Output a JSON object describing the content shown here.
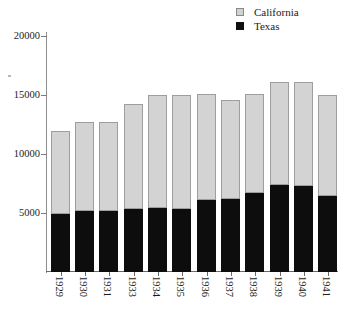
{
  "legend": {
    "position": "top-right",
    "items": [
      {
        "label": "California",
        "color": "#d3d3d3",
        "swatch": "california-swatch"
      },
      {
        "label": "Texas",
        "color": "#0d0d0d",
        "swatch": "texas-swatch"
      }
    ]
  },
  "axis": {
    "y_ticks": [
      "5000",
      "10000",
      "15000",
      "20000"
    ],
    "y_tick_values": [
      5000,
      10000,
      15000,
      20000
    ]
  },
  "chart_data": {
    "type": "bar",
    "stacked": true,
    "title": "",
    "subtitle": "",
    "xlabel": "",
    "ylabel": "",
    "ylim": [
      0,
      20000
    ],
    "yticks": [
      5000,
      10000,
      15000,
      20000
    ],
    "grid": false,
    "legend_position": "top-right",
    "categories": [
      "1929",
      "1930",
      "1931",
      "1933",
      "1934",
      "1935",
      "1936",
      "1937",
      "1938",
      "1939",
      "1940",
      "1941"
    ],
    "series": [
      {
        "name": "Texas",
        "color": "#0d0d0d",
        "values": [
          4900,
          5200,
          5200,
          5300,
          5400,
          5300,
          6100,
          6200,
          6700,
          7400,
          7300,
          6400
        ]
      },
      {
        "name": "California",
        "color": "#d3d3d3",
        "values": [
          7050,
          7500,
          7500,
          8900,
          9600,
          9700,
          8950,
          8400,
          8400,
          8700,
          8800,
          8600
        ]
      }
    ],
    "totals": [
      11950,
      12700,
      12700,
      14200,
      15000,
      15000,
      15050,
      14600,
      15100,
      16100,
      16100,
      15000
    ]
  }
}
